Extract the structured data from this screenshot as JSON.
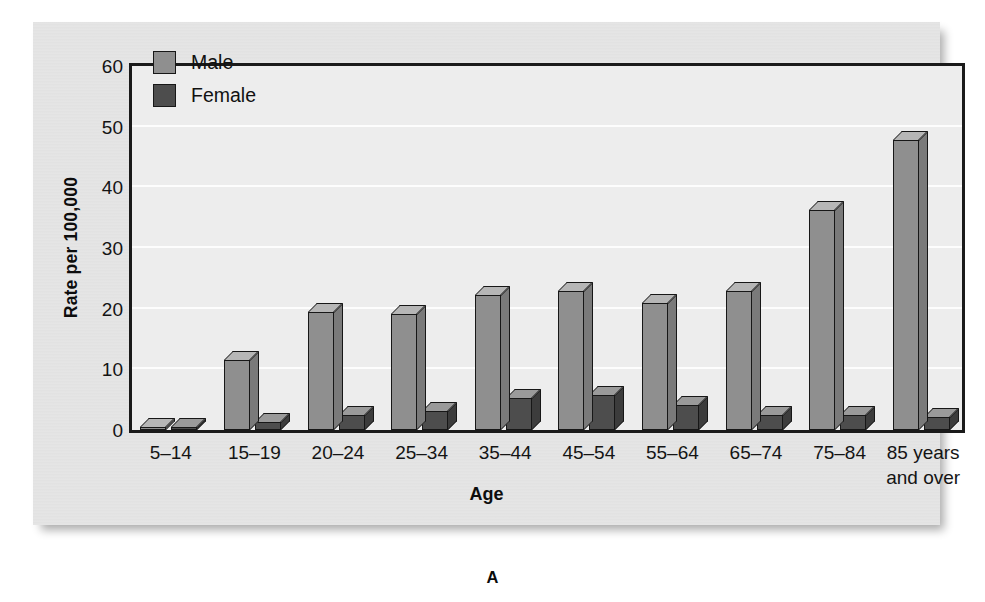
{
  "figure": {
    "caption_letter": "A"
  },
  "legend": {
    "position": "top-left-inside",
    "items": [
      {
        "label": "Male",
        "color": "#8f8f8f"
      },
      {
        "label": "Female",
        "color": "#4d4d4d"
      }
    ]
  },
  "axes": {
    "ylabel": "Rate per 100,000",
    "xlabel": "Age",
    "yticks": [
      "0",
      "10",
      "20",
      "30",
      "40",
      "50",
      "60"
    ]
  },
  "chart_data": {
    "type": "bar",
    "title": "",
    "subtitle": "",
    "xlabel": "Age",
    "ylabel": "Rate per 100,000",
    "ylim": [
      0,
      60
    ],
    "ytick_values": [
      0,
      10,
      20,
      30,
      40,
      50,
      60
    ],
    "grid": true,
    "grid_axis": "y",
    "legend_position": "upper left",
    "style": "3d-bar",
    "categories": [
      "5–14",
      "15–19",
      "20–24",
      "25–34",
      "35–44",
      "45–54",
      "55–64",
      "65–74",
      "75–84",
      "85 years\nand over"
    ],
    "series": [
      {
        "name": "Male",
        "color": "#8f8f8f",
        "values": [
          0.3,
          11.5,
          19.5,
          19.2,
          22.3,
          22.9,
          21.0,
          22.9,
          36.3,
          47.8
        ]
      },
      {
        "name": "Female",
        "color": "#4d4d4d",
        "values": [
          0.1,
          1.4,
          2.4,
          3.1,
          5.2,
          5.8,
          4.1,
          2.4,
          2.4,
          2.1
        ]
      }
    ]
  }
}
